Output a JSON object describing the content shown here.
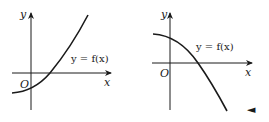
{
  "graphs": [
    {
      "id": "left",
      "axis_labels": {
        "x": "x",
        "y": "y",
        "origin": "O"
      },
      "curve_label": "y = f(x)",
      "description": "increasing concave-up curve crossing x-axis at positive x"
    },
    {
      "id": "right",
      "axis_labels": {
        "x": "x",
        "y": "y",
        "origin": "O"
      },
      "curve_label": "y = f(x)",
      "description": "decreasing concave-down curve crossing x-axis at positive x"
    }
  ],
  "marker": {
    "glyph": "◄"
  },
  "colors": {
    "ink": "#1a1a1a",
    "background": "#ffffff"
  }
}
